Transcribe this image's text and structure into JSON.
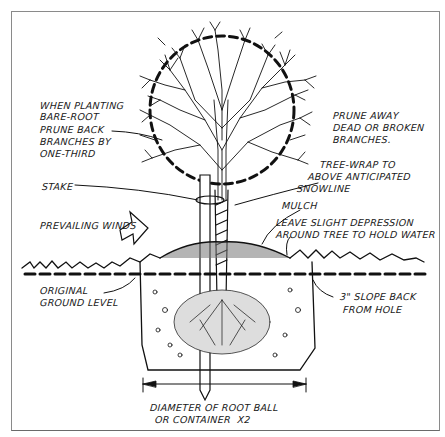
{
  "diagram": {
    "labels": {
      "bare_root_1": "WHEN PLANTING",
      "bare_root_2": "BARE-ROOT",
      "bare_root_3": "PRUNE BACK",
      "bare_root_4": "BRANCHES BY",
      "bare_root_5": "ONE-THIRD",
      "prune_1": "PRUNE AWAY",
      "prune_2": "DEAD OR BROKEN",
      "prune_3": "BRANCHES.",
      "wrap_1": "TREE-WRAP TO",
      "wrap_2": "ABOVE ANTICIPATED",
      "wrap_3": "SNOWLINE",
      "stake": "STAKE",
      "mulch": "MULCH",
      "depression_1": "LEAVE SLIGHT DEPRESSION",
      "depression_2": "AROUND TREE TO HOLD WATER",
      "winds": "PREVAILING WINDS",
      "ground_1": "ORIGINAL",
      "ground_2": "GROUND LEVEL",
      "slope_1": "3\" SLOPE BACK",
      "slope_2": "FROM HOLE",
      "diameter_1": "DIAMETER OF ROOT BALL",
      "diameter_2": "OR CONTAINER  X2"
    },
    "colors": {
      "ink": "#111111",
      "frame": "#8a8a8a",
      "background": "#ffffff"
    }
  }
}
